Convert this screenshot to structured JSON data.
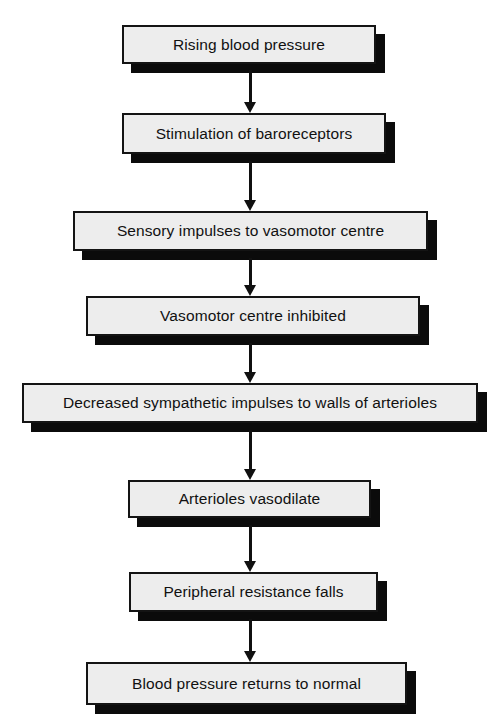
{
  "diagram": {
    "type": "flowchart",
    "orientation": "top-to-bottom",
    "colors": {
      "box_fill": "#ededed",
      "box_border": "#141414",
      "shadow": "#0b0b0b",
      "arrow": "#101010",
      "text": "#111111",
      "background": "#ffffff"
    },
    "nodes": [
      {
        "id": "node-1",
        "label": "Rising blood pressure",
        "x": 122,
        "y": 25,
        "w": 254,
        "h": 39
      },
      {
        "id": "node-2",
        "label": "Stimulation of baroreceptors",
        "x": 122,
        "y": 113,
        "w": 264,
        "h": 41
      },
      {
        "id": "node-3",
        "label": "Sensory impulses to vasomotor centre",
        "x": 73,
        "y": 211,
        "w": 355,
        "h": 40
      },
      {
        "id": "node-4",
        "label": "Vasomotor centre inhibited",
        "x": 86,
        "y": 296,
        "w": 334,
        "h": 40
      },
      {
        "id": "node-5",
        "label": "Decreased sympathetic impulses to walls of arterioles",
        "x": 22,
        "y": 383,
        "w": 456,
        "h": 40
      },
      {
        "id": "node-6",
        "label": "Arterioles vasodilate",
        "x": 128,
        "y": 480,
        "w": 243,
        "h": 38
      },
      {
        "id": "node-7",
        "label": "Peripheral resistance falls",
        "x": 129,
        "y": 572,
        "w": 249,
        "h": 40
      },
      {
        "id": "node-8",
        "label": "Blood pressure returns to normal",
        "x": 86,
        "y": 662,
        "w": 321,
        "h": 43
      }
    ],
    "edges": [
      {
        "id": "edge-1",
        "from": "node-1",
        "to": "node-2",
        "x": 250,
        "y": 70,
        "length": 43
      },
      {
        "id": "edge-2",
        "from": "node-2",
        "to": "node-3",
        "x": 250,
        "y": 161,
        "length": 50
      },
      {
        "id": "edge-3",
        "from": "node-3",
        "to": "node-4",
        "x": 250,
        "y": 258,
        "length": 38
      },
      {
        "id": "edge-4",
        "from": "node-4",
        "to": "node-5",
        "x": 250,
        "y": 343,
        "length": 40
      },
      {
        "id": "edge-5",
        "from": "node-5",
        "to": "node-6",
        "x": 250,
        "y": 430,
        "length": 50
      },
      {
        "id": "edge-6",
        "from": "node-6",
        "to": "node-7",
        "x": 250,
        "y": 525,
        "length": 47
      },
      {
        "id": "edge-7",
        "from": "node-7",
        "to": "node-8",
        "x": 250,
        "y": 619,
        "length": 43
      }
    ]
  }
}
